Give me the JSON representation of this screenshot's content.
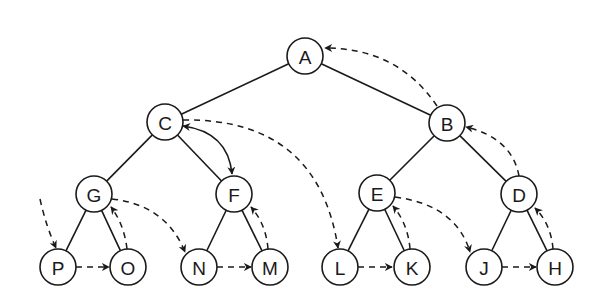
{
  "diagram": {
    "type": "threaded binary tree",
    "colors": {
      "stroke": "#1a1a1a",
      "background": "#ffffff",
      "node_fill": "#ffffff"
    },
    "nodes": [
      {
        "id": "A",
        "label": "A",
        "x": 305,
        "y": 56
      },
      {
        "id": "C",
        "label": "C",
        "x": 165,
        "y": 122
      },
      {
        "id": "B",
        "label": "B",
        "x": 447,
        "y": 123
      },
      {
        "id": "G",
        "label": "G",
        "x": 94,
        "y": 194
      },
      {
        "id": "F",
        "label": "F",
        "x": 234,
        "y": 194
      },
      {
        "id": "E",
        "label": "E",
        "x": 377,
        "y": 193
      },
      {
        "id": "D",
        "label": "D",
        "x": 519,
        "y": 194
      },
      {
        "id": "P",
        "label": "P",
        "x": 58,
        "y": 267
      },
      {
        "id": "O",
        "label": "O",
        "x": 128,
        "y": 267
      },
      {
        "id": "N",
        "label": "N",
        "x": 199,
        "y": 267
      },
      {
        "id": "M",
        "label": "M",
        "x": 270,
        "y": 267
      },
      {
        "id": "L",
        "label": "L",
        "x": 340,
        "y": 267
      },
      {
        "id": "K",
        "label": "K",
        "x": 412,
        "y": 267
      },
      {
        "id": "J",
        "label": "J",
        "x": 484,
        "y": 267
      },
      {
        "id": "H",
        "label": "H",
        "x": 555,
        "y": 267
      }
    ],
    "tree_edges": [
      [
        "A",
        "C"
      ],
      [
        "A",
        "B"
      ],
      [
        "C",
        "G"
      ],
      [
        "C",
        "F"
      ],
      [
        "B",
        "E"
      ],
      [
        "B",
        "D"
      ],
      [
        "G",
        "P"
      ],
      [
        "G",
        "O"
      ],
      [
        "F",
        "N"
      ],
      [
        "F",
        "M"
      ],
      [
        "E",
        "L"
      ],
      [
        "E",
        "K"
      ],
      [
        "D",
        "J"
      ],
      [
        "D",
        "H"
      ]
    ],
    "dashed_threads": [
      {
        "from": "start",
        "to": "P"
      },
      {
        "from": "P",
        "to": "O"
      },
      {
        "from": "O",
        "to": "G"
      },
      {
        "from": "G",
        "to": "N"
      },
      {
        "from": "N",
        "to": "M"
      },
      {
        "from": "M",
        "to": "F"
      },
      {
        "from": "C",
        "to": "L"
      },
      {
        "from": "L",
        "to": "K"
      },
      {
        "from": "K",
        "to": "E"
      },
      {
        "from": "E",
        "to": "J"
      },
      {
        "from": "J",
        "to": "H"
      },
      {
        "from": "H",
        "to": "D"
      },
      {
        "from": "D",
        "to": "B"
      },
      {
        "from": "B",
        "to": "A"
      }
    ],
    "solid_bidirectional": [
      {
        "between": [
          "C",
          "F"
        ]
      }
    ]
  }
}
